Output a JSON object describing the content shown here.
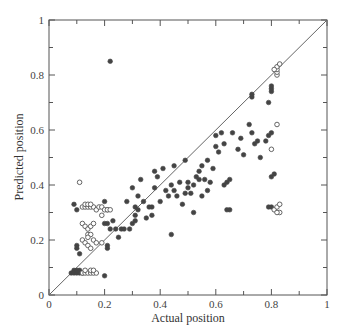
{
  "chart_data": {
    "type": "scatter",
    "title": "",
    "xlabel": "Actual position",
    "ylabel": "Predicted position",
    "xlim": [
      0,
      1
    ],
    "ylim": [
      0,
      1
    ],
    "x_ticks": [
      "0",
      "0.2",
      "0.4",
      "0.6",
      "0.8",
      "1"
    ],
    "y_ticks": [
      "0",
      "0.2",
      "0.4",
      "0.6",
      "0.8",
      "1"
    ],
    "grid": false,
    "legend": null,
    "reference_line": {
      "type": "diagonal",
      "from": [
        0,
        0
      ],
      "to": [
        1,
        1
      ]
    },
    "series": [
      {
        "name": "filled",
        "marker": "filled-circle",
        "color": "#444444",
        "points": [
          [
            0.22,
            0.85
          ],
          [
            0.09,
            0.33
          ],
          [
            0.1,
            0.31
          ],
          [
            0.2,
            0.34
          ],
          [
            0.21,
            0.31
          ],
          [
            0.21,
            0.26
          ],
          [
            0.2,
            0.26
          ],
          [
            0.22,
            0.24
          ],
          [
            0.23,
            0.27
          ],
          [
            0.1,
            0.17
          ],
          [
            0.1,
            0.18
          ],
          [
            0.11,
            0.15
          ],
          [
            0.2,
            0.07
          ],
          [
            0.21,
            0.18
          ],
          [
            0.21,
            0.17
          ],
          [
            0.08,
            0.08
          ],
          [
            0.09,
            0.08
          ],
          [
            0.1,
            0.08
          ],
          [
            0.11,
            0.08
          ],
          [
            0.12,
            0.08
          ],
          [
            0.09,
            0.09
          ],
          [
            0.1,
            0.09
          ],
          [
            0.11,
            0.09
          ],
          [
            0.24,
            0.24
          ],
          [
            0.25,
            0.21
          ],
          [
            0.26,
            0.24
          ],
          [
            0.27,
            0.24
          ],
          [
            0.28,
            0.34
          ],
          [
            0.29,
            0.24
          ],
          [
            0.3,
            0.26
          ],
          [
            0.3,
            0.39
          ],
          [
            0.31,
            0.32
          ],
          [
            0.31,
            0.29
          ],
          [
            0.31,
            0.27
          ],
          [
            0.32,
            0.31
          ],
          [
            0.32,
            0.36
          ],
          [
            0.33,
            0.42
          ],
          [
            0.34,
            0.34
          ],
          [
            0.35,
            0.28
          ],
          [
            0.36,
            0.32
          ],
          [
            0.37,
            0.32
          ],
          [
            0.37,
            0.29
          ],
          [
            0.38,
            0.45
          ],
          [
            0.38,
            0.39
          ],
          [
            0.39,
            0.43
          ],
          [
            0.4,
            0.34
          ],
          [
            0.41,
            0.46
          ],
          [
            0.42,
            0.38
          ],
          [
            0.43,
            0.36
          ],
          [
            0.44,
            0.22
          ],
          [
            0.44,
            0.4
          ],
          [
            0.45,
            0.47
          ],
          [
            0.45,
            0.38
          ],
          [
            0.46,
            0.36
          ],
          [
            0.47,
            0.41
          ],
          [
            0.48,
            0.33
          ],
          [
            0.49,
            0.37
          ],
          [
            0.49,
            0.49
          ],
          [
            0.5,
            0.41
          ],
          [
            0.5,
            0.39
          ],
          [
            0.51,
            0.37
          ],
          [
            0.52,
            0.4
          ],
          [
            0.52,
            0.3
          ],
          [
            0.53,
            0.43
          ],
          [
            0.54,
            0.45
          ],
          [
            0.54,
            0.42
          ],
          [
            0.55,
            0.47
          ],
          [
            0.55,
            0.36
          ],
          [
            0.56,
            0.42
          ],
          [
            0.57,
            0.49
          ],
          [
            0.57,
            0.38
          ],
          [
            0.58,
            0.41
          ],
          [
            0.59,
            0.46
          ],
          [
            0.6,
            0.54
          ],
          [
            0.6,
            0.58
          ],
          [
            0.61,
            0.52
          ],
          [
            0.62,
            0.59
          ],
          [
            0.63,
            0.55
          ],
          [
            0.63,
            0.4
          ],
          [
            0.64,
            0.41
          ],
          [
            0.64,
            0.31
          ],
          [
            0.65,
            0.31
          ],
          [
            0.65,
            0.42
          ],
          [
            0.66,
            0.59
          ],
          [
            0.68,
            0.53
          ],
          [
            0.69,
            0.57
          ],
          [
            0.7,
            0.51
          ],
          [
            0.72,
            0.62
          ],
          [
            0.73,
            0.59
          ],
          [
            0.74,
            0.55
          ],
          [
            0.75,
            0.56
          ],
          [
            0.76,
            0.5
          ],
          [
            0.78,
            0.56
          ],
          [
            0.79,
            0.58
          ],
          [
            0.79,
            0.7
          ],
          [
            0.8,
            0.59
          ],
          [
            0.8,
            0.74
          ],
          [
            0.8,
            0.75
          ],
          [
            0.8,
            0.76
          ],
          [
            0.8,
            0.43
          ],
          [
            0.81,
            0.44
          ],
          [
            0.79,
            0.32
          ],
          [
            0.8,
            0.32
          ],
          [
            0.73,
            0.72
          ],
          [
            0.73,
            0.73
          ]
        ]
      },
      {
        "name": "open",
        "marker": "open-circle",
        "color": "#555555",
        "points": [
          [
            0.11,
            0.41
          ],
          [
            0.12,
            0.32
          ],
          [
            0.13,
            0.32
          ],
          [
            0.14,
            0.32
          ],
          [
            0.15,
            0.32
          ],
          [
            0.16,
            0.32
          ],
          [
            0.17,
            0.31
          ],
          [
            0.18,
            0.32
          ],
          [
            0.19,
            0.32
          ],
          [
            0.2,
            0.31
          ],
          [
            0.21,
            0.31
          ],
          [
            0.22,
            0.31
          ],
          [
            0.13,
            0.33
          ],
          [
            0.14,
            0.33
          ],
          [
            0.15,
            0.33
          ],
          [
            0.19,
            0.29
          ],
          [
            0.12,
            0.26
          ],
          [
            0.13,
            0.25
          ],
          [
            0.14,
            0.24
          ],
          [
            0.15,
            0.25
          ],
          [
            0.16,
            0.26
          ],
          [
            0.14,
            0.22
          ],
          [
            0.15,
            0.22
          ],
          [
            0.14,
            0.21
          ],
          [
            0.12,
            0.2
          ],
          [
            0.13,
            0.19
          ],
          [
            0.14,
            0.18
          ],
          [
            0.15,
            0.17
          ],
          [
            0.16,
            0.2
          ],
          [
            0.17,
            0.19
          ],
          [
            0.19,
            0.19
          ],
          [
            0.12,
            0.08
          ],
          [
            0.13,
            0.08
          ],
          [
            0.14,
            0.08
          ],
          [
            0.15,
            0.08
          ],
          [
            0.16,
            0.08
          ],
          [
            0.17,
            0.08
          ],
          [
            0.13,
            0.09
          ],
          [
            0.15,
            0.09
          ],
          [
            0.16,
            0.09
          ],
          [
            0.82,
            0.8
          ],
          [
            0.82,
            0.81
          ],
          [
            0.82,
            0.82
          ],
          [
            0.82,
            0.83
          ],
          [
            0.83,
            0.84
          ],
          [
            0.81,
            0.82
          ],
          [
            0.82,
            0.62
          ],
          [
            0.8,
            0.53
          ],
          [
            0.81,
            0.31
          ],
          [
            0.82,
            0.32
          ],
          [
            0.83,
            0.33
          ],
          [
            0.83,
            0.3
          ],
          [
            0.82,
            0.3
          ]
        ]
      }
    ]
  }
}
